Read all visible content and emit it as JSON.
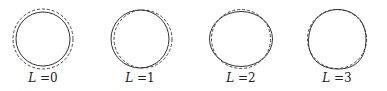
{
  "figure": {
    "panels": [
      {
        "id": "L0",
        "label_var": "L",
        "label_eq": "=",
        "label_val": "0",
        "cx": 43,
        "cy": 39,
        "label_x": 43
      },
      {
        "id": "L1",
        "label_var": "L",
        "label_eq": "=",
        "label_val": "1",
        "cx": 140,
        "cy": 39,
        "label_x": 140
      },
      {
        "id": "L2",
        "label_var": "L",
        "label_eq": "=",
        "label_val": "2",
        "cx": 241,
        "cy": 39,
        "label_x": 241
      },
      {
        "id": "L3",
        "label_var": "L",
        "label_eq": "=",
        "label_val": "3",
        "cx": 337,
        "cy": 39,
        "label_x": 337
      }
    ],
    "reference_shape": "dashed circle",
    "deformed_shape": "solid curve",
    "colors": {
      "stroke": "#333333",
      "background": "#ffffff"
    }
  }
}
